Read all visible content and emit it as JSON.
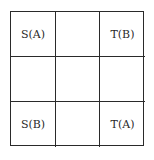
{
  "grid": {
    "rows": 3,
    "cols": 3,
    "cells": [
      [
        "S(A)",
        "",
        "T(B)"
      ],
      [
        "",
        "",
        ""
      ],
      [
        "S(B)",
        "",
        "T(A)"
      ]
    ]
  }
}
